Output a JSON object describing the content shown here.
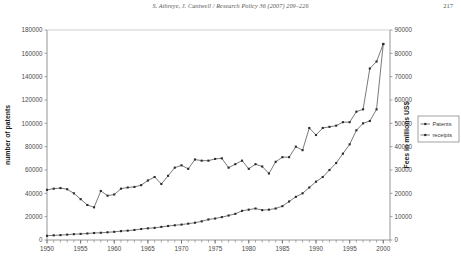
{
  "header": {
    "running_head": "S. Athreye, J. Cantwell / Research Policy 36 (2007) 209–226",
    "page_number": "217"
  },
  "caption": {
    "text": ""
  },
  "legend": {
    "position": "right",
    "items": [
      {
        "label": "Patents",
        "marker": "diamond-marker"
      },
      {
        "label": "receipts",
        "marker": "diamond-marker"
      }
    ]
  },
  "chart_data": {
    "type": "line",
    "title": "",
    "xlabel": "year",
    "ylabel": "number of patents",
    "y2label": "Fees in millions US$",
    "grid": false,
    "xlim": [
      1950,
      2001
    ],
    "ylim": [
      0,
      180000
    ],
    "y2lim": [
      0,
      90000
    ],
    "xtick_labels": [
      "1950",
      "1955",
      "1960",
      "1965",
      "1970",
      "1975",
      "1980",
      "1985",
      "1990",
      "1995",
      "2000"
    ],
    "xtick_values": [
      1950,
      1955,
      1960,
      1965,
      1970,
      1975,
      1980,
      1985,
      1990,
      1995,
      2000
    ],
    "ytick_labels": [
      "0",
      "20000",
      "40000",
      "60000",
      "80000",
      "100000",
      "120000",
      "140000",
      "160000",
      "180000"
    ],
    "ytick_values": [
      0,
      20000,
      40000,
      60000,
      80000,
      100000,
      120000,
      140000,
      160000,
      180000
    ],
    "y2tick_labels": [
      "0",
      "10000",
      "20000",
      "30000",
      "40000",
      "50000",
      "60000",
      "70000",
      "80000",
      "90000"
    ],
    "y2tick_values": [
      0,
      10000,
      20000,
      30000,
      40000,
      50000,
      60000,
      70000,
      80000,
      90000
    ],
    "x": [
      1950,
      1951,
      1952,
      1953,
      1954,
      1955,
      1956,
      1957,
      1958,
      1959,
      1960,
      1961,
      1962,
      1963,
      1964,
      1965,
      1966,
      1967,
      1968,
      1969,
      1970,
      1971,
      1972,
      1973,
      1974,
      1975,
      1976,
      1977,
      1978,
      1979,
      1980,
      1981,
      1982,
      1983,
      1984,
      1985,
      1986,
      1987,
      1988,
      1989,
      1990,
      1991,
      1992,
      1993,
      1994,
      1995,
      1996,
      1997,
      1998,
      1999,
      2000
    ],
    "series": [
      {
        "name": "Patents",
        "axis": "left",
        "values": [
          43000,
          44000,
          44500,
          43500,
          40000,
          35000,
          30000,
          28000,
          42000,
          38000,
          39000,
          44000,
          45000,
          45500,
          47000,
          51000,
          54000,
          48000,
          55000,
          62000,
          64000,
          61000,
          69000,
          68000,
          68000,
          69500,
          70000,
          62000,
          65000,
          68000,
          61000,
          65000,
          63000,
          57000,
          67000,
          71000,
          71000,
          80000,
          77000,
          96000,
          90000,
          96000,
          97000,
          98000,
          101000,
          101000,
          110000,
          112000,
          147000,
          153000,
          168000
        ]
      },
      {
        "name": "receipts",
        "axis": "right",
        "values": [
          1800,
          2000,
          2100,
          2300,
          2500,
          2600,
          2800,
          3000,
          3100,
          3300,
          3500,
          3800,
          4000,
          4300,
          4700,
          5000,
          5200,
          5600,
          6000,
          6300,
          6600,
          7000,
          7400,
          8000,
          8800,
          9200,
          9800,
          10500,
          11200,
          12500,
          13000,
          13500,
          12800,
          13000,
          13500,
          14500,
          16500,
          18500,
          20000,
          22500,
          25000,
          27000,
          30000,
          33000,
          37000,
          41000,
          47000,
          50000,
          51000,
          56000,
          84000
        ]
      }
    ]
  }
}
